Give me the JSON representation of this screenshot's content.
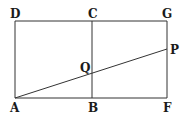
{
  "diagram": {
    "type": "geometry",
    "points": {
      "A": {
        "label": "A",
        "x": 15,
        "y": 98
      },
      "B": {
        "label": "B",
        "x": 92,
        "y": 98
      },
      "F": {
        "label": "F",
        "x": 167,
        "y": 98
      },
      "D": {
        "label": "D",
        "x": 15,
        "y": 21
      },
      "C": {
        "label": "C",
        "x": 92,
        "y": 21
      },
      "G": {
        "label": "G",
        "x": 167,
        "y": 21
      },
      "P": {
        "label": "P",
        "x": 167,
        "y": 49
      },
      "Q": {
        "label": "Q",
        "x": 92,
        "y": 74
      }
    },
    "segments": [
      "AF",
      "DG",
      "AD",
      "BC",
      "FG",
      "AP"
    ],
    "line_color": "#333333",
    "label_color": "#1a1a1a"
  }
}
